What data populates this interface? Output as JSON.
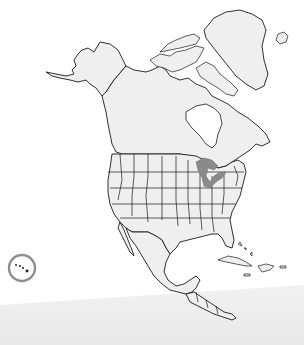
{
  "map": {
    "title": "",
    "region": "North America",
    "style": "outline map, grayscale",
    "features": [
      {
        "name": "Alaska",
        "type": "state-region"
      },
      {
        "name": "Canada",
        "type": "country"
      },
      {
        "name": "Greenland",
        "type": "territory"
      },
      {
        "name": "Hudson Bay",
        "type": "water"
      },
      {
        "name": "United States (state borders)",
        "type": "country"
      },
      {
        "name": "Great Lakes",
        "type": "water",
        "highlighted": true
      },
      {
        "name": "Mexico",
        "type": "country"
      },
      {
        "name": "Central America",
        "type": "region"
      },
      {
        "name": "Caribbean islands",
        "type": "islands"
      },
      {
        "name": "Hawaii",
        "type": "islands",
        "circled": true
      }
    ],
    "colors": {
      "land": "#efefef",
      "outline": "#1a1a1a",
      "great_lakes": "#8a8a8a",
      "hawaii_circle": "#8e8e8e",
      "background": "#ffffff",
      "bottom_shadow": "#ececec"
    }
  }
}
